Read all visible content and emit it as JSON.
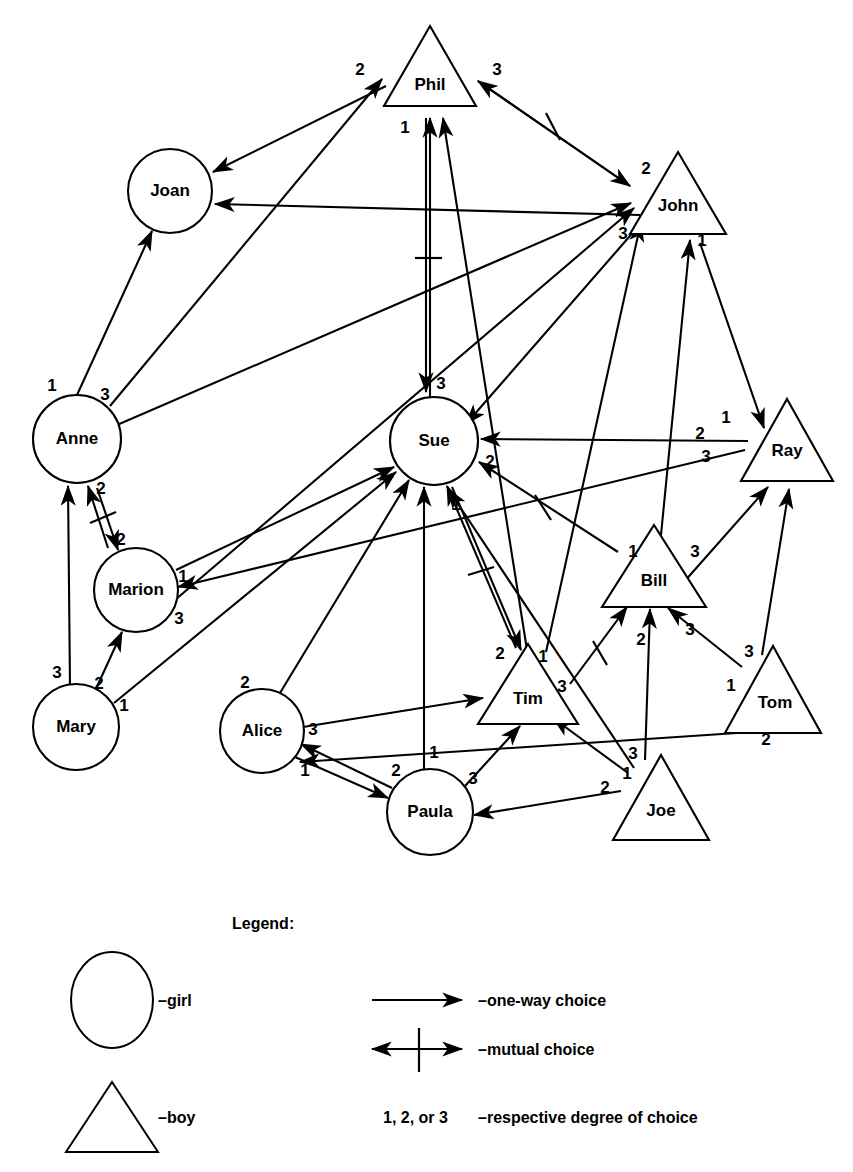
{
  "diagram": {
    "type": "sociogram",
    "title": "",
    "nodes": [
      {
        "id": "phil",
        "label": "Phil",
        "shape": "triangle",
        "gender": "boy",
        "cx": 430,
        "cy": 72,
        "r": 46
      },
      {
        "id": "joan",
        "label": "Joan",
        "shape": "circle",
        "gender": "girl",
        "cx": 170,
        "cy": 191,
        "r": 42
      },
      {
        "id": "john",
        "label": "John",
        "shape": "triangle",
        "gender": "boy",
        "cx": 678,
        "cy": 200,
        "r": 46
      },
      {
        "id": "anne",
        "label": "Anne",
        "shape": "circle",
        "gender": "girl",
        "cx": 77,
        "cy": 439,
        "r": 44
      },
      {
        "id": "sue",
        "label": "Sue",
        "shape": "circle",
        "gender": "girl",
        "cx": 434,
        "cy": 441,
        "r": 44
      },
      {
        "id": "ray",
        "label": "Ray",
        "shape": "triangle",
        "gender": "boy",
        "cx": 787,
        "cy": 443,
        "r": 45
      },
      {
        "id": "marion",
        "label": "Marion",
        "shape": "circle",
        "gender": "girl",
        "cx": 136,
        "cy": 590,
        "r": 42
      },
      {
        "id": "bill",
        "label": "Bill",
        "shape": "triangle",
        "gender": "boy",
        "cx": 654,
        "cy": 573,
        "r": 48
      },
      {
        "id": "mary",
        "label": "Mary",
        "shape": "circle",
        "gender": "girl",
        "cx": 76,
        "cy": 727,
        "r": 43
      },
      {
        "id": "alice",
        "label": "Alice",
        "shape": "circle",
        "gender": "girl",
        "cx": 262,
        "cy": 731,
        "r": 42
      },
      {
        "id": "tim",
        "label": "Tim",
        "shape": "triangle",
        "gender": "boy",
        "cx": 528,
        "cy": 690,
        "r": 47
      },
      {
        "id": "tom",
        "label": "Tom",
        "shape": "triangle",
        "gender": "boy",
        "cx": 773,
        "cy": 692,
        "r": 46
      },
      {
        "id": "paula",
        "label": "Paula",
        "shape": "circle",
        "gender": "girl",
        "cx": 430,
        "cy": 812,
        "r": 43
      },
      {
        "id": "joe",
        "label": "Joe",
        "shape": "triangle",
        "gender": "boy",
        "cx": 661,
        "cy": 799,
        "r": 46
      }
    ],
    "edges": [
      {
        "from": "anne",
        "to": "phil",
        "degree": "2",
        "mutual": false
      },
      {
        "from": "anne",
        "to": "joan",
        "degree": "1",
        "mutual": false
      },
      {
        "from": "anne",
        "to": "john",
        "degree": "3",
        "mutual": false
      },
      {
        "from": "phil",
        "to": "joan",
        "degree": "",
        "mutual": false
      },
      {
        "from": "phil",
        "to": "john",
        "degree": "3",
        "mutual": true
      },
      {
        "from": "phil",
        "to": "sue",
        "degree": "3",
        "mutual": true
      },
      {
        "from": "sue",
        "to": "phil",
        "degree": "1",
        "mutual": true
      },
      {
        "from": "john",
        "to": "ray",
        "degree": "1",
        "mutual": false
      },
      {
        "from": "john",
        "to": "sue",
        "degree": "",
        "mutual": false
      },
      {
        "from": "marion",
        "to": "anne",
        "degree": "2",
        "mutual": true
      },
      {
        "from": "anne",
        "to": "marion",
        "degree": "2",
        "mutual": true
      },
      {
        "from": "marion",
        "to": "sue",
        "degree": "1",
        "mutual": false
      },
      {
        "from": "marion",
        "to": "john",
        "degree": "3",
        "mutual": false
      },
      {
        "from": "mary",
        "to": "anne",
        "degree": "3",
        "mutual": false
      },
      {
        "from": "mary",
        "to": "marion",
        "degree": "2",
        "mutual": false
      },
      {
        "from": "mary",
        "to": "sue",
        "degree": "1",
        "mutual": false
      },
      {
        "from": "ray",
        "to": "sue",
        "degree": "2",
        "mutual": false
      },
      {
        "from": "ray",
        "to": "marion",
        "degree": "3",
        "mutual": false
      },
      {
        "from": "bill",
        "to": "sue",
        "degree": "2",
        "mutual": true
      },
      {
        "from": "bill",
        "to": "ray",
        "degree": "3",
        "mutual": false
      },
      {
        "from": "bill",
        "to": "john",
        "degree": "1",
        "mutual": false
      },
      {
        "from": "tim",
        "to": "sue",
        "degree": "1",
        "mutual": true
      },
      {
        "from": "tim",
        "to": "bill",
        "degree": "2",
        "mutual": true
      },
      {
        "from": "tim",
        "to": "john",
        "degree": "3",
        "mutual": false
      },
      {
        "from": "alice",
        "to": "sue",
        "degree": "2",
        "mutual": false
      },
      {
        "from": "alice",
        "to": "tim",
        "degree": "3",
        "mutual": false
      },
      {
        "from": "alice",
        "to": "paula",
        "degree": "1",
        "mutual": false
      },
      {
        "from": "paula",
        "to": "alice",
        "degree": "2",
        "mutual": false
      },
      {
        "from": "paula",
        "to": "sue",
        "degree": "1",
        "mutual": false
      },
      {
        "from": "paula",
        "to": "tim",
        "degree": "3",
        "mutual": false
      },
      {
        "from": "joe",
        "to": "bill",
        "degree": "3",
        "mutual": false
      },
      {
        "from": "joe",
        "to": "paula",
        "degree": "2",
        "mutual": false
      },
      {
        "from": "joe",
        "to": "tim",
        "degree": "1",
        "mutual": false
      },
      {
        "from": "tom",
        "to": "bill",
        "degree": "1",
        "mutual": false
      },
      {
        "from": "tom",
        "to": "ray",
        "degree": "3",
        "mutual": false
      },
      {
        "from": "tom",
        "to": "paula",
        "degree": "2",
        "mutual": false
      }
    ],
    "degree_marks": [
      {
        "id": "m-phil-left",
        "text": "2",
        "x": 360,
        "y": 71
      },
      {
        "id": "m-phil-right",
        "text": "3",
        "x": 497,
        "y": 71
      },
      {
        "id": "m-phil-below",
        "text": "1",
        "x": 405,
        "y": 129
      },
      {
        "id": "m-john-upper",
        "text": "2",
        "x": 646,
        "y": 170
      },
      {
        "id": "m-john-lower",
        "text": "3",
        "x": 623,
        "y": 235
      },
      {
        "id": "m-john-right",
        "text": "1",
        "x": 702,
        "y": 242
      },
      {
        "id": "m-anne-1",
        "text": "1",
        "x": 52,
        "y": 387
      },
      {
        "id": "m-anne-3",
        "text": "3",
        "x": 105,
        "y": 396
      },
      {
        "id": "m-anne-2",
        "text": "2",
        "x": 101,
        "y": 490
      },
      {
        "id": "m-marion-2",
        "text": "2",
        "x": 121,
        "y": 541
      },
      {
        "id": "m-marion-1",
        "text": "1",
        "x": 183,
        "y": 578
      },
      {
        "id": "m-marion-3",
        "text": "3",
        "x": 179,
        "y": 620
      },
      {
        "id": "m-mary-3",
        "text": "3",
        "x": 57,
        "y": 674
      },
      {
        "id": "m-mary-2",
        "text": "2",
        "x": 99,
        "y": 685
      },
      {
        "id": "m-mary-1",
        "text": "1",
        "x": 124,
        "y": 707
      },
      {
        "id": "m-sue-3",
        "text": "3",
        "x": 441,
        "y": 385
      },
      {
        "id": "m-sue-2",
        "text": "2",
        "x": 490,
        "y": 463
      },
      {
        "id": "m-sue-1",
        "text": "1",
        "x": 456,
        "y": 506
      },
      {
        "id": "m-ray-1",
        "text": "1",
        "x": 726,
        "y": 419
      },
      {
        "id": "m-ray-2",
        "text": "2",
        "x": 700,
        "y": 435
      },
      {
        "id": "m-ray-3",
        "text": "3",
        "x": 706,
        "y": 458
      },
      {
        "id": "m-bill-1",
        "text": "1",
        "x": 633,
        "y": 553
      },
      {
        "id": "m-bill-3",
        "text": "3",
        "x": 695,
        "y": 553
      },
      {
        "id": "m-bill-2",
        "text": "2",
        "x": 641,
        "y": 641
      },
      {
        "id": "m-bill-ray-3",
        "text": "3",
        "x": 690,
        "y": 631
      },
      {
        "id": "m-tim-2",
        "text": "2",
        "x": 500,
        "y": 655
      },
      {
        "id": "m-tim-1",
        "text": "1",
        "x": 543,
        "y": 658
      },
      {
        "id": "m-tim-3",
        "text": "3",
        "x": 562,
        "y": 688
      },
      {
        "id": "m-tom-3",
        "text": "3",
        "x": 749,
        "y": 653
      },
      {
        "id": "m-tom-1",
        "text": "1",
        "x": 731,
        "y": 687
      },
      {
        "id": "m-tom-2",
        "text": "2",
        "x": 766,
        "y": 741
      },
      {
        "id": "m-alice-2",
        "text": "2",
        "x": 245,
        "y": 684
      },
      {
        "id": "m-alice-3",
        "text": "3",
        "x": 313,
        "y": 731
      },
      {
        "id": "m-alice-1",
        "text": "1",
        "x": 305,
        "y": 772
      },
      {
        "id": "m-paula-2",
        "text": "2",
        "x": 396,
        "y": 772
      },
      {
        "id": "m-paula-1",
        "text": "1",
        "x": 434,
        "y": 754
      },
      {
        "id": "m-paula-3",
        "text": "3",
        "x": 473,
        "y": 780
      },
      {
        "id": "m-joe-3",
        "text": "3",
        "x": 633,
        "y": 755
      },
      {
        "id": "m-joe-1",
        "text": "1",
        "x": 627,
        "y": 775
      },
      {
        "id": "m-joe-2",
        "text": "2",
        "x": 605,
        "y": 789
      }
    ]
  },
  "legend": {
    "title": "Legend:",
    "girl_label": "–girl",
    "boy_label": "–boy",
    "one_way_label": "–one-way choice",
    "mutual_label": "–mutual choice",
    "degrees_label": "1, 2, or 3",
    "degrees_desc": "–respective degree of choice"
  },
  "colors": {
    "ink": "#000000",
    "paper": "#ffffff"
  }
}
